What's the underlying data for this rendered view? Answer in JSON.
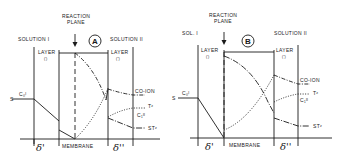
{
  "panels": [
    {
      "id": "A",
      "circle_label": "A",
      "reaction_plane": [
        "REACTION",
        "PLANE"
      ],
      "solution_left": "SOLUTION I",
      "solution_right": "SOLUTION II",
      "layer_left": "LAYER",
      "layer_left_sub": "(')",
      "layer_right": "LAYER",
      "layer_right_sub": "('')",
      "left_bulk_symbol": "S",
      "left_conc": "C₀ᴵ",
      "right_conc": "C₁ᴵᴵ",
      "curve_labels": [
        "CO-ION",
        "Tᶻ",
        "STᶻ"
      ],
      "bottom_labels": {
        "delta_left": "δ'",
        "membrane": "MEMBRANE",
        "delta_right": "δ''"
      }
    },
    {
      "id": "B",
      "circle_label": "B",
      "reaction_plane": [
        "REACTION",
        "PLANE"
      ],
      "solution_left": "SOL. I",
      "solution_right": "SOLUTION II",
      "layer_left": "LAYER",
      "layer_left_sub": "(')",
      "layer_right": "LAYER",
      "layer_right_sub": "('')",
      "left_bulk_symbol": "S",
      "left_conc": "C₀ᴵ",
      "right_conc": "C₁ᴵᴵ",
      "curve_labels": [
        "CO-ION",
        "Tᶻ",
        "STᶻ"
      ],
      "bottom_labels": {
        "delta_left": "δ'",
        "membrane": "MEMBRANE",
        "delta_right": "δ''"
      }
    }
  ]
}
